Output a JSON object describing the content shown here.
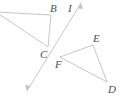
{
  "figure": {
    "canvas": {
      "width": 121,
      "height": 98,
      "background": "#ffffff"
    },
    "style": {
      "stroke_color": "#c6c6c6",
      "stroke_width": 1,
      "label_color": "#4c4c4c",
      "label_font_size": 11,
      "label_style": "italic"
    },
    "labels": {
      "B": "B",
      "C": "C",
      "D": "D",
      "E": "E",
      "F": "F",
      "I": "I"
    },
    "label_positions": {
      "B": {
        "x": 50,
        "y": 12
      },
      "C": {
        "x": 40,
        "y": 58
      },
      "D": {
        "x": 108,
        "y": 93
      },
      "E": {
        "x": 93,
        "y": 42
      },
      "F": {
        "x": 55,
        "y": 68
      },
      "I": {
        "x": 68,
        "y": 12
      }
    },
    "points": {
      "A_offscreen": {
        "x": -4,
        "y": 12
      },
      "B": {
        "x": 51,
        "y": 15
      },
      "C": {
        "x": 48,
        "y": 47
      },
      "D": {
        "x": 107,
        "y": 82
      },
      "E": {
        "x": 93,
        "y": 45
      },
      "F": {
        "x": 60,
        "y": 57
      },
      "line_top": {
        "x": 81,
        "y": 3
      },
      "line_bottom": {
        "x": 27,
        "y": 91
      }
    },
    "shapes": [
      {
        "name": "left-triangle",
        "kind": "polygon",
        "vertices": [
          "A_offscreen",
          "B",
          "C"
        ],
        "labels": [
          "B",
          "C"
        ]
      },
      {
        "name": "right-triangle",
        "kind": "polygon",
        "vertices": [
          "F",
          "E",
          "D"
        ],
        "labels": [
          "E",
          "F",
          "D"
        ]
      },
      {
        "name": "transversal-line",
        "kind": "double-arrow-line",
        "from": "line_bottom",
        "to": "line_top",
        "label": "I"
      }
    ]
  }
}
